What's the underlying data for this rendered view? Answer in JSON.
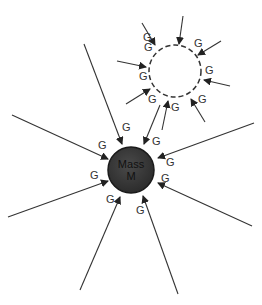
{
  "diagram": {
    "type": "gravity-flux-illustration",
    "mass_label_line1": "Mass",
    "mass_label_line2": "M",
    "field_label": "G",
    "mass": {
      "cx": 131,
      "cy": 170,
      "r": 23,
      "fill": "#3a3a3a"
    },
    "empty_region": {
      "cx": 175,
      "cy": 71,
      "r": 26,
      "style": "dashed"
    },
    "g_labels": [
      {
        "x": 143,
        "y": 41
      },
      {
        "x": 194,
        "y": 47
      },
      {
        "x": 144,
        "y": 51
      },
      {
        "x": 205,
        "y": 74
      },
      {
        "x": 139,
        "y": 80
      },
      {
        "x": 148,
        "y": 103
      },
      {
        "x": 171,
        "y": 111
      },
      {
        "x": 198,
        "y": 103
      },
      {
        "x": 122,
        "y": 131
      },
      {
        "x": 152,
        "y": 145
      },
      {
        "x": 98,
        "y": 149
      },
      {
        "x": 166,
        "y": 166
      },
      {
        "x": 90,
        "y": 179
      },
      {
        "x": 161,
        "y": 182
      },
      {
        "x": 106,
        "y": 203
      },
      {
        "x": 136,
        "y": 214
      }
    ],
    "arrows": [
      {
        "x1": 142,
        "y1": 23,
        "x2": 155,
        "y2": 45
      },
      {
        "x1": 183,
        "y1": 16,
        "x2": 179,
        "y2": 44
      },
      {
        "x1": 221,
        "y1": 41,
        "x2": 198,
        "y2": 55
      },
      {
        "x1": 117,
        "y1": 61,
        "x2": 146,
        "y2": 67
      },
      {
        "x1": 230,
        "y1": 86,
        "x2": 204,
        "y2": 80
      },
      {
        "x1": 126,
        "y1": 104,
        "x2": 150,
        "y2": 89
      },
      {
        "x1": 205,
        "y1": 122,
        "x2": 191,
        "y2": 99
      },
      {
        "x1": 162,
        "y1": 130,
        "x2": 168,
        "y2": 101
      },
      {
        "x1": 84,
        "y1": 44,
        "x2": 122,
        "y2": 144
      },
      {
        "x1": 160,
        "y1": 105,
        "x2": 144,
        "y2": 144
      },
      {
        "x1": 12,
        "y1": 115,
        "x2": 108,
        "y2": 159
      },
      {
        "x1": 254,
        "y1": 123,
        "x2": 158,
        "y2": 158
      },
      {
        "x1": 8,
        "y1": 217,
        "x2": 108,
        "y2": 181
      },
      {
        "x1": 252,
        "y1": 226,
        "x2": 158,
        "y2": 183
      },
      {
        "x1": 80,
        "y1": 290,
        "x2": 120,
        "y2": 197
      },
      {
        "x1": 178,
        "y1": 294,
        "x2": 143,
        "y2": 196
      }
    ]
  }
}
